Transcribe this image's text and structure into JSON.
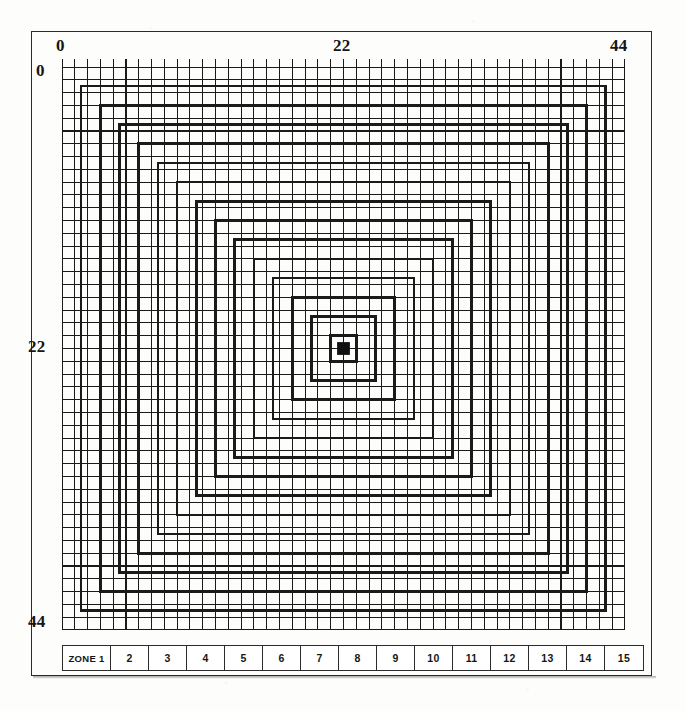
{
  "figure": {
    "type": "zone-grid-diagram",
    "background_color": "#fdfdfb",
    "ink_color": "#1a1a1a"
  },
  "axes": {
    "top": {
      "labels": [
        "0",
        "22",
        "44"
      ],
      "values": [
        0,
        22,
        44
      ]
    },
    "left": {
      "labels": [
        "0",
        "22",
        "44"
      ],
      "values": [
        0,
        22,
        44
      ]
    },
    "range": [
      0,
      44
    ],
    "tick_interval": 1
  },
  "chart_data": {
    "type": "heatmap",
    "title": "",
    "xlabel": "",
    "ylabel": "",
    "xlim": [
      0,
      44
    ],
    "ylim": [
      0,
      44
    ],
    "grid": true,
    "legend_position": "bottom",
    "cells_x": 44,
    "cells_y": 44,
    "center_cell": {
      "x": 22,
      "y": 22,
      "fill": "#111111"
    },
    "zone_rings": [
      {
        "zone": 15,
        "half_width": 22.0
      },
      {
        "zone": 14,
        "half_width": 20.5
      },
      {
        "zone": 13,
        "half_width": 19.0
      },
      {
        "zone": 12,
        "half_width": 17.5
      },
      {
        "zone": 11,
        "half_width": 16.0
      },
      {
        "zone": 10,
        "half_width": 14.5
      },
      {
        "zone": 9,
        "half_width": 13.0
      },
      {
        "zone": 8,
        "half_width": 11.5
      },
      {
        "zone": 7,
        "half_width": 10.0
      },
      {
        "zone": 6,
        "half_width": 8.5
      },
      {
        "zone": 5,
        "half_width": 7.0
      },
      {
        "zone": 4,
        "half_width": 5.5
      },
      {
        "zone": 3,
        "half_width": 4.0
      },
      {
        "zone": 2,
        "half_width": 2.5
      },
      {
        "zone": 1,
        "half_width": 1.0
      }
    ]
  },
  "zone_legend": {
    "cells": [
      {
        "label": "ZONE 1",
        "wide": true
      },
      {
        "label": "2"
      },
      {
        "label": "3"
      },
      {
        "label": "4"
      },
      {
        "label": "5"
      },
      {
        "label": "6"
      },
      {
        "label": "7"
      },
      {
        "label": "8"
      },
      {
        "label": "9"
      },
      {
        "label": "10"
      },
      {
        "label": "11"
      },
      {
        "label": "12"
      },
      {
        "label": "13"
      },
      {
        "label": "14"
      },
      {
        "label": "15"
      }
    ]
  }
}
